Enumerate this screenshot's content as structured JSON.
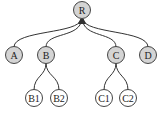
{
  "diagram": {
    "type": "tree",
    "colors": {
      "internal_fill": "#d4d4d4",
      "leaf_fill": "#ffffff",
      "stroke": "#444444"
    },
    "nodes": [
      {
        "id": "R",
        "label": "R",
        "x": 82,
        "y": 10,
        "fill": "gray"
      },
      {
        "id": "A",
        "label": "A",
        "x": 14,
        "y": 55,
        "fill": "gray"
      },
      {
        "id": "B",
        "label": "B",
        "x": 46,
        "y": 55,
        "fill": "gray"
      },
      {
        "id": "C",
        "label": "C",
        "x": 116,
        "y": 55,
        "fill": "gray"
      },
      {
        "id": "D",
        "label": "D",
        "x": 148,
        "y": 55,
        "fill": "gray"
      },
      {
        "id": "B1",
        "label": "B1",
        "x": 34,
        "y": 98,
        "fill": "white"
      },
      {
        "id": "B2",
        "label": "B2",
        "x": 59,
        "y": 98,
        "fill": "white"
      },
      {
        "id": "C1",
        "label": "C1",
        "x": 104,
        "y": 98,
        "fill": "white"
      },
      {
        "id": "C2",
        "label": "C2",
        "x": 128,
        "y": 98,
        "fill": "white"
      }
    ],
    "edges": [
      {
        "from": "A",
        "to": "R",
        "arrow": true
      },
      {
        "from": "B",
        "to": "R",
        "arrow": true
      },
      {
        "from": "C",
        "to": "R",
        "arrow": true
      },
      {
        "from": "D",
        "to": "R",
        "arrow": true
      },
      {
        "from": "B1",
        "to": "B"
      },
      {
        "from": "B2",
        "to": "B"
      },
      {
        "from": "C1",
        "to": "C"
      },
      {
        "from": "C2",
        "to": "C"
      }
    ]
  }
}
